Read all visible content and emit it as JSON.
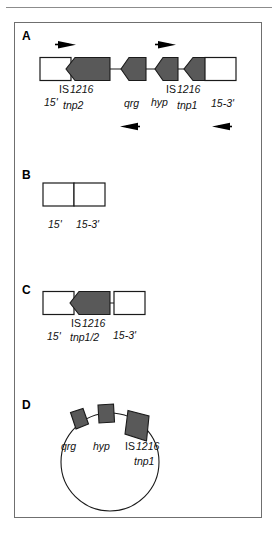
{
  "figure": {
    "background_color": "#ffffff",
    "frame_color": "#6f6f6f",
    "gene_fill_color": "#595959",
    "gene_stroke_color": "#1a1a1a",
    "box_fill_color": "#ffffff",
    "line_color": "#1a1a1a",
    "arrow_color": "#000000",
    "panels": [
      {
        "letter": "A",
        "name": "linear-map-full-transposon",
        "elements": [
          {
            "kind": "box",
            "name": "is-element-left-box"
          },
          {
            "kind": "gene-arrow",
            "name": "tnp2-gene",
            "direction": "left"
          },
          {
            "kind": "gene-arrow",
            "name": "qrg-gene",
            "direction": "left"
          },
          {
            "kind": "gene-arrow",
            "name": "hyp-gene",
            "direction": "left"
          },
          {
            "kind": "gene-arrow",
            "name": "tnp1-gene",
            "direction": "left"
          },
          {
            "kind": "box",
            "name": "is-element-right-box"
          }
        ],
        "primer_arrows_top": [
          {
            "name": "primer-arrow-forward-1",
            "direction": "right"
          },
          {
            "name": "primer-arrow-forward-2",
            "direction": "right"
          }
        ],
        "primer_arrows_bottom": [
          {
            "name": "primer-arrow-reverse-1",
            "direction": "left"
          },
          {
            "name": "primer-arrow-reverse-2",
            "direction": "left"
          }
        ],
        "labels": {
          "is_left_top": "IS",
          "is_left_num": "1216",
          "five_prime_left": "15'",
          "tnp2": "tnp2",
          "qrg": "qrg",
          "hyp": "hyp",
          "is_right_top": "IS",
          "is_right_num": "1216",
          "tnp1": "tnp1",
          "three_prime_right": "15-3'"
        }
      },
      {
        "letter": "B",
        "name": "linear-map-deleted",
        "elements": [
          {
            "kind": "box",
            "name": "left-junction-box"
          },
          {
            "kind": "box",
            "name": "right-junction-box"
          }
        ],
        "labels": {
          "five_prime_left": "15'",
          "three_prime_right": "15-3'"
        }
      },
      {
        "letter": "C",
        "name": "linear-map-single-tnp",
        "elements": [
          {
            "kind": "box",
            "name": "left-junction-box"
          },
          {
            "kind": "gene-arrow",
            "name": "tnp1-2-gene",
            "direction": "left"
          },
          {
            "kind": "box",
            "name": "right-junction-box"
          }
        ],
        "labels": {
          "five_prime_left": "15'",
          "is_top": "IS",
          "is_num": "1216",
          "tnp12": "tnp1/2",
          "three_prime_right": "15-3'"
        }
      },
      {
        "letter": "D",
        "name": "circular-plasmid-map",
        "elements": [
          {
            "kind": "circle",
            "name": "plasmid-circle"
          },
          {
            "kind": "gene-arrow",
            "name": "qrg-gene"
          },
          {
            "kind": "gene-arrow",
            "name": "hyp-gene"
          },
          {
            "kind": "gene-arrow",
            "name": "tnp1-gene"
          }
        ],
        "labels": {
          "qrg": "qrg",
          "hyp": "hyp",
          "is_top": "IS",
          "is_num": "1216",
          "tnp1": "tnp1"
        }
      }
    ]
  }
}
